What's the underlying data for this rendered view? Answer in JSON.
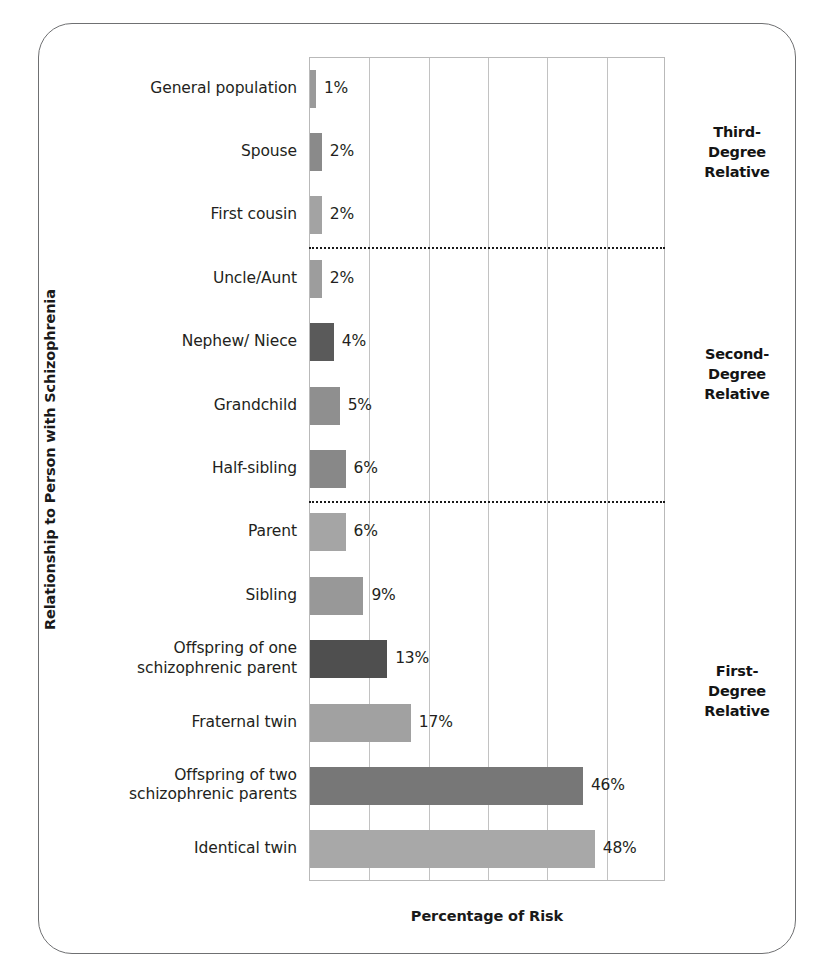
{
  "figure": {
    "y_axis_title": "Relationship to Person with Schizophrenia",
    "x_axis_title": "Percentage of Risk"
  },
  "groups": [
    {
      "name": "third-degree",
      "line1": "Third-",
      "line2": "Degree",
      "line3": "Relative"
    },
    {
      "name": "second-degree",
      "line1": "Second-",
      "line2": "Degree",
      "line3": "Relative"
    },
    {
      "name": "first-degree",
      "line1": "First-",
      "line2": "Degree",
      "line3": "Relative"
    }
  ],
  "chart_data": {
    "type": "bar",
    "orientation": "horizontal",
    "title": "",
    "xlabel": "Percentage of Risk",
    "ylabel": "Relationship to Person with Schizophrenia",
    "xlim": [
      0,
      60
    ],
    "grid": true,
    "gridlines": [
      10,
      20,
      30,
      40,
      50
    ],
    "legend": "none",
    "categories": [
      "General population",
      "Spouse",
      "First cousin",
      "Uncle/Aunt",
      "Nephew/ Niece",
      "Grandchild",
      "Half-sibling",
      "Parent",
      "Sibling",
      "Offspring of one schizophrenic parent",
      "Fraternal twin",
      "Offspring of two schizophrenic parents",
      "Identical twin"
    ],
    "values": [
      1,
      2,
      2,
      2,
      4,
      5,
      6,
      6,
      9,
      13,
      17,
      46,
      48
    ],
    "value_labels": [
      "1%",
      "2%",
      "2%",
      "2%",
      "4%",
      "5%",
      "6%",
      "6%",
      "9%",
      "13%",
      "17%",
      "46%",
      "48%"
    ],
    "bar_colors": [
      "#9a9a9a",
      "#8a8a8a",
      "#a3a3a3",
      "#9d9d9d",
      "#5a5a5a",
      "#8f8f8f",
      "#888888",
      "#a5a5a5",
      "#989898",
      "#4f4f4f",
      "#a1a1a1",
      "#777777",
      "#a8a8a8"
    ],
    "category_labels_multiline": {
      "Offspring of one schizophrenic parent": [
        "Offspring of one",
        "schizophrenic parent"
      ],
      "Offspring of two schizophrenic parents": [
        "Offspring of two",
        "schizophrenic parents"
      ]
    },
    "groups": [
      {
        "label": "Third-Degree Relative",
        "categories": [
          "General population",
          "Spouse",
          "First cousin"
        ]
      },
      {
        "label": "Second-Degree Relative",
        "categories": [
          "Uncle/Aunt",
          "Nephew/ Niece",
          "Grandchild",
          "Half-sibling"
        ]
      },
      {
        "label": "First-Degree Relative",
        "categories": [
          "Parent",
          "Sibling",
          "Offspring of one schizophrenic parent",
          "Fraternal twin",
          "Offspring of two schizophrenic parents",
          "Identical twin"
        ]
      }
    ],
    "separators_after": [
      "First cousin",
      "Half-sibling"
    ]
  }
}
